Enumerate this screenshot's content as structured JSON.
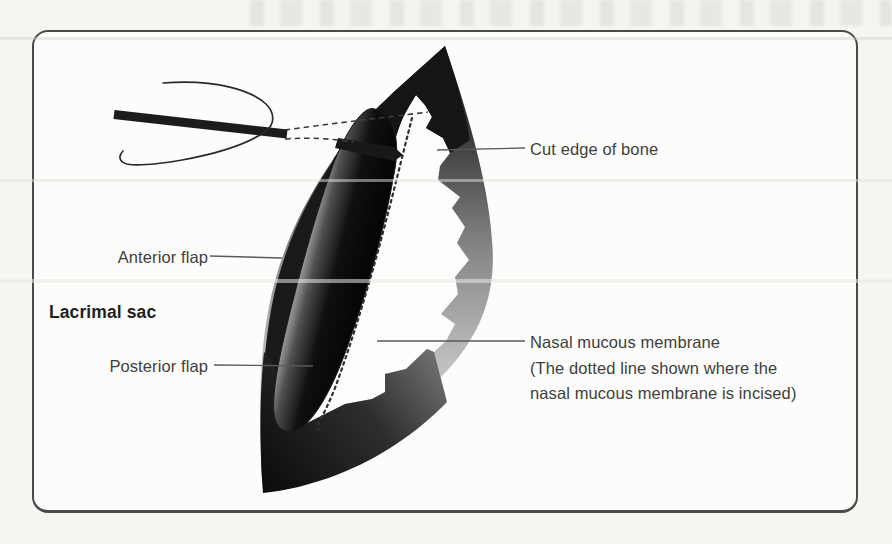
{
  "figure": {
    "type": "surgical-anatomy-diagram",
    "labels": {
      "anterior_flap": "Anterior flap",
      "lacrimal_sac": "Lacrimal sac",
      "posterior_flap": "Posterior flap",
      "cut_edge_of_bone": "Cut edge of bone",
      "nasal_membrane": {
        "line1": "Nasal mucous membrane",
        "line2": "(The dotted line shown where the",
        "line3": "nasal mucous membrane is incised)"
      }
    },
    "icons": [
      "scalpel-handle-icon",
      "hand-outline-icon",
      "blade-tip-icon",
      "dashed-blade-path-icon",
      "dotted-incision-line-icon"
    ],
    "colors": {
      "page_background": "#f5f4f1",
      "panel_background": "#fcfcfa",
      "panel_border": "#4a4a4a",
      "ink_dark": "#141414",
      "label_text": "#3f3f3f",
      "label_text_bold": "#1f1f1f",
      "leader_line": "#5a5a5a",
      "crescent_light": "#dadada"
    }
  }
}
